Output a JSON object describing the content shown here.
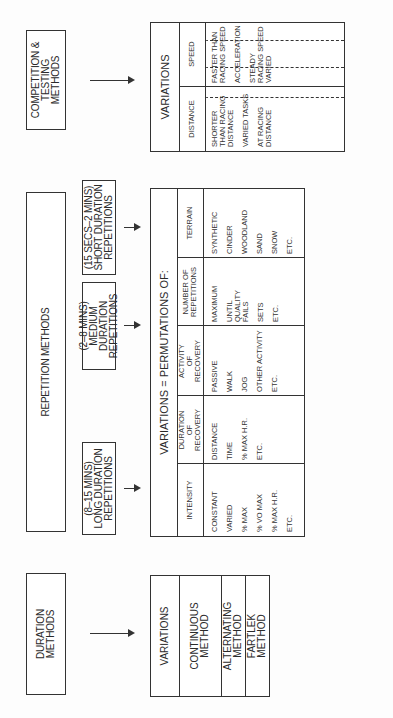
{
  "top_boxes": {
    "duration": "DURATION METHODS",
    "repetition": "REPETITION METHODS",
    "competition": "COMPETITION & TESTING METHODS"
  },
  "repetition_sub": [
    {
      "range": "(8–15 MINS)",
      "label": "LONG DURATION",
      "suffix": "REPETITIONS"
    },
    {
      "range": "(2–8 MINS)",
      "label": "MEDIUM DURATION",
      "suffix": "REPETITIONS"
    },
    {
      "range": "(15 SECS–2 MINS)",
      "label": "SHORT DURATION",
      "suffix": "REPETITIONS"
    }
  ],
  "duration_variations": {
    "header": "VARIATIONS",
    "rows": [
      "CONTINUOUS METHOD",
      "ALTERNATING METHOD",
      "FARTLEK METHOD"
    ]
  },
  "permutations": {
    "title": "VARIATIONS = PERMUTATIONS OF:",
    "columns": [
      {
        "header": "INTENSITY",
        "items": [
          "CONSTANT",
          "VARIED",
          "% MAX",
          "% VO MAX",
          "% MAX H.R.",
          "ETC."
        ]
      },
      {
        "header": "DURATION OF RECOVERY",
        "items": [
          "DISTANCE",
          "TIME",
          "% MAX H.R.",
          "ETC."
        ]
      },
      {
        "header": "ACTIVITY OF RECOVERY",
        "items": [
          "PASSIVE",
          "WALK",
          "JOG",
          "OTHER ACTIVITY",
          "ETC."
        ]
      },
      {
        "header": "NUMBER OF REPETITIONS",
        "items": [
          "MAXIMUM",
          "UNTIL QUALITY FAILS",
          "SETS",
          "ETC."
        ]
      },
      {
        "header": "TERRAIN",
        "items": [
          "SYNTHETIC",
          "CINDER",
          "WOODLAND",
          "SAND",
          "SNOW",
          "ETC."
        ]
      }
    ]
  },
  "competition_variations": {
    "title": "VARIATIONS",
    "headers": {
      "distance": "DISTANCE",
      "speed": "SPEED"
    },
    "groups": [
      {
        "distance": [
          "SHORTER THAN RACING DISTANCE",
          "VARIED TASKS",
          "AT RACING DISTANCE"
        ],
        "speed": [
          "FASTER THAN RACING SPEED",
          "ACCELERATION",
          "STEADY RACING SPEED VARIED"
        ]
      },
      {
        "distance": [
          "OVER DISTANCE"
        ],
        "speed": [
          "SLOWER THAN RACING SPEED VARIED"
        ]
      },
      {
        "distance": [
          "TIME TRIAL OVER, UNDER, EQUAL TO RACING DISTANCE"
        ],
        "speed": [
          "MAXIMUM POSSIBLE SPEED TARGET SPEED"
        ]
      },
      {
        "distance": [
          "ETC."
        ],
        "speed": [
          "ETC."
        ]
      }
    ]
  }
}
